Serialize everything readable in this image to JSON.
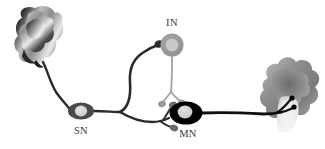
{
  "figure": {
    "background_color": "#ffffff"
  },
  "labels": {
    "sensory_neuron": "SN",
    "interneuron": "IN",
    "motor_neuron": "MN"
  },
  "cells": {
    "sensory_neuron": {
      "name": "SN",
      "soma_fill": "#cfcfcf",
      "soma_outline": "#4a4a4a",
      "nucleus_fill": "#d9d9d9",
      "cx": 81,
      "cy": 111,
      "rx": 12,
      "ry": 8
    },
    "interneuron": {
      "name": "IN",
      "soma_fill": "#9a9a9a",
      "nucleus_fill": "#c8c8c8",
      "cx": 172,
      "cy": 45,
      "r": 11
    },
    "motor_neuron": {
      "name": "MN",
      "soma_fill": "#000000",
      "nucleus_fill": "#d5d5d5",
      "cx": 186,
      "cy": 113,
      "rx": 16,
      "ry": 11
    }
  },
  "organs": {
    "receptor": {
      "name": "sensory-receptor-organ",
      "position": "left",
      "fill_light": "#f2f2f2",
      "fill_dark": "#3b3b3b"
    },
    "muscle": {
      "name": "muscle-effector-organ",
      "position": "right",
      "fill_light": "#efefef",
      "fill_dark": "#6e6e6e"
    }
  },
  "connections": {
    "sn_axon_color": "#2b2b2b",
    "in_axon_color": "#9a9a9a",
    "mn_axon_color": "#1a1a1a",
    "terminal_dark": "#555555",
    "terminal_light": "#9a9a9a"
  }
}
